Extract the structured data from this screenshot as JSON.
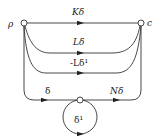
{
  "diagram": {
    "nodes": {
      "source": {
        "label": "ρ"
      },
      "target": {
        "label": "c"
      },
      "middle": {
        "label": ""
      }
    },
    "edges": {
      "top": {
        "label": "Kδ"
      },
      "second": {
        "label": "Lδ"
      },
      "third": {
        "label": "-Lδ¹"
      },
      "outer_left": {
        "label": "δ"
      },
      "outer_right": {
        "label": "Nδ"
      },
      "loop": {
        "label": "δ¹"
      }
    },
    "colors": {
      "stroke": "#333333",
      "text": "#222222",
      "background": "#ffffff"
    }
  }
}
